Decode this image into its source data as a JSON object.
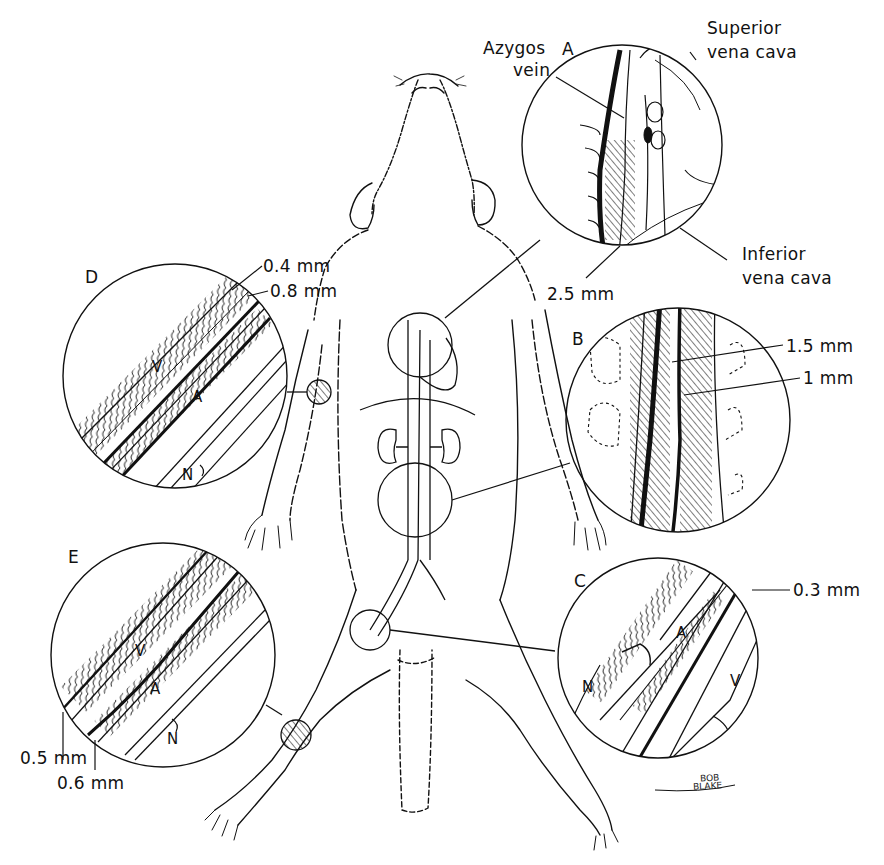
{
  "figure": {
    "stroke_color": "#111111",
    "background": "#ffffff"
  },
  "insets": {
    "A": {
      "letter": "A",
      "labels": {
        "azygos_line1": "Azygos",
        "azygos_line2": "vein",
        "svc_line1": "Superior",
        "svc_line2": "vena cava",
        "ivc_line1": "Inferior",
        "ivc_line2": "vena cava",
        "measure": "2.5 mm"
      }
    },
    "B": {
      "letter": "B",
      "labels": {
        "m1": "1.5 mm",
        "m2": "1 mm"
      }
    },
    "C": {
      "letter": "C",
      "labels": {
        "measure": "0.3 mm",
        "artery": "A",
        "vein": "V",
        "nerve": "N"
      }
    },
    "D": {
      "letter": "D",
      "labels": {
        "m1": "0.4 mm",
        "m2": "0.8 mm",
        "vein": "V",
        "artery": "A",
        "nerve": "N"
      }
    },
    "E": {
      "letter": "E",
      "labels": {
        "m1": "0.5 mm",
        "m2": "0.6 mm",
        "vein": "V",
        "artery": "A",
        "nerve": "N"
      }
    }
  },
  "signature": {
    "line1": "BOB",
    "line2": "BLAKE"
  }
}
